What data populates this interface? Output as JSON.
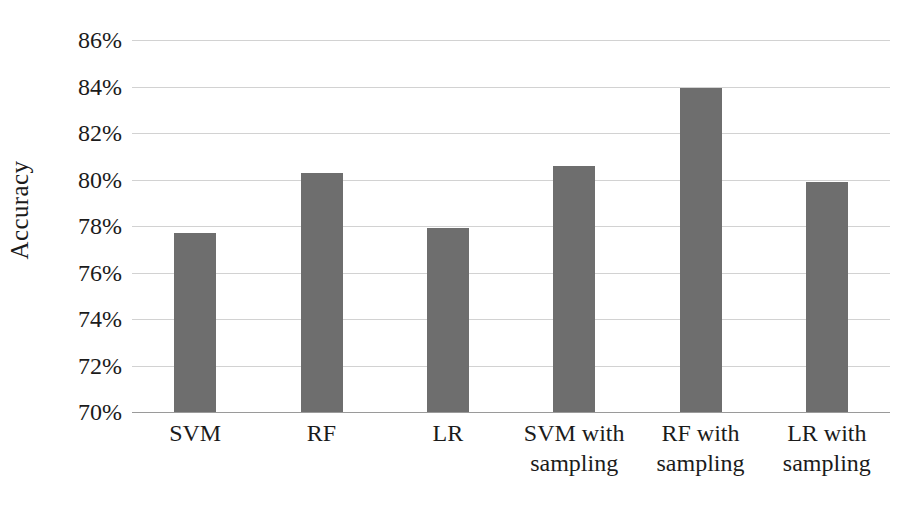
{
  "chart_data": {
    "type": "bar",
    "title": "",
    "subtitle": "",
    "xlabel": "",
    "ylabel": "Accuracy",
    "categories": [
      "SVM",
      "RF",
      "LR",
      "SVM with sampling",
      "RF with sampling",
      "LR with sampling"
    ],
    "category_lines": [
      [
        "SVM"
      ],
      [
        "RF"
      ],
      [
        "LR"
      ],
      [
        "SVM with",
        "sampling"
      ],
      [
        "RF with",
        "sampling"
      ],
      [
        "LR with",
        "sampling"
      ]
    ],
    "values": [
      77.7,
      80.3,
      77.9,
      80.6,
      83.95,
      79.9
    ],
    "value_labels": [
      "77.7%",
      "80.3%",
      "77.9%",
      "80.6%",
      "84.0%",
      "79.9%"
    ],
    "ylim": [
      70,
      86
    ],
    "ytick_values": [
      86,
      84,
      82,
      80,
      78,
      76,
      74,
      72,
      70
    ],
    "ytick_labels": [
      "86%",
      "84%",
      "82%",
      "80%",
      "78%",
      "76%",
      "74%",
      "72%",
      "70%"
    ],
    "grid": true,
    "legend": false,
    "legend_position": "none",
    "series": [
      {
        "name": "Accuracy",
        "values": [
          77.7,
          80.3,
          77.9,
          80.6,
          83.95,
          79.9
        ]
      }
    ],
    "colors": {
      "bar": "#6e6e6e",
      "gridline": "#d2d2d2",
      "axis": "#9a9a9a",
      "text": "#1b1b1b",
      "background": "#ffffff"
    }
  }
}
